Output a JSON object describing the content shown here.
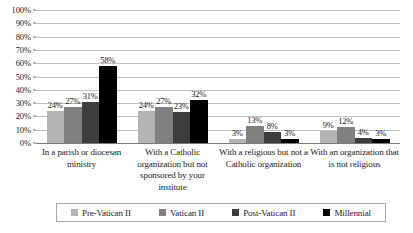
{
  "chart_data": {
    "type": "bar",
    "title": "",
    "xlabel": "",
    "ylabel": "",
    "ylim": [
      0,
      100
    ],
    "grid": true,
    "legend_position": "bottom",
    "value_suffix": "%",
    "categories": [
      "In a parish or diocesan ministry",
      "With a Catholic organization but not sponsored by your institute",
      "With a religious but not a Catholic organization",
      "With an organization that is not religious"
    ],
    "series": [
      {
        "name": "Pre-Vatican II",
        "color": "#b3b3b3",
        "values": [
          24,
          24,
          3,
          9
        ]
      },
      {
        "name": "Vatican II",
        "color": "#808080",
        "values": [
          27,
          27,
          13,
          12
        ]
      },
      {
        "name": "Post-Vatican II",
        "color": "#3d3d3d",
        "values": [
          31,
          23,
          8,
          4
        ]
      },
      {
        "name": "Millennial",
        "color": "#000000",
        "values": [
          58,
          32,
          3,
          3
        ]
      }
    ],
    "y_ticks": [
      "0%",
      "10%",
      "20%",
      "30%",
      "40%",
      "50%",
      "60%",
      "70%",
      "80%",
      "90%",
      "100%"
    ],
    "data_labels": {
      "group1": [
        "24%",
        "27%",
        "31%",
        "58%"
      ],
      "group2": [
        "24%",
        "27%",
        "23%",
        "32%"
      ],
      "group3": [
        "3%",
        "13%",
        "8%",
        "3%"
      ],
      "group4": [
        "9%",
        "12%",
        "4%",
        "3%"
      ]
    }
  },
  "legend": {
    "items": [
      {
        "label": "Pre-Vatican II"
      },
      {
        "label": "Vatican II"
      },
      {
        "label": "Post-Vatican II"
      },
      {
        "label": "Millennial"
      }
    ]
  }
}
